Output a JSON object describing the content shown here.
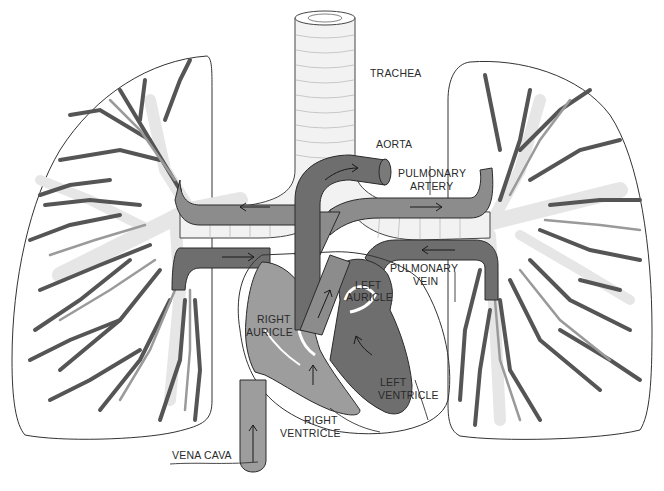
{
  "diagram": {
    "colors": {
      "background": "#ffffff",
      "oxygenated_vessel": "#8c8c8c",
      "deoxygenated_vessel": "#6e6e6e",
      "right_heart": "#9d9d9d",
      "left_heart": "#6e6e6e",
      "airway": "#f2f2f2",
      "outline": "#333333"
    },
    "labels": {
      "trachea": "TRACHEA",
      "aorta": "AORTA",
      "pulmonary_artery_1": "PULMONARY",
      "pulmonary_artery_2": "ARTERY",
      "pulmonary_vein_1": "PULMONARY",
      "pulmonary_vein_2": "VEIN",
      "left_auricle_1": "LEFT",
      "left_auricle_2": "AURICLE",
      "right_auricle_1": "RIGHT",
      "right_auricle_2": "AURICLE",
      "left_ventricle_1": "LEFT",
      "left_ventricle_2": "VENTRICLE",
      "right_ventricle_1": "RIGHT",
      "right_ventricle_2": "VENTRICLE",
      "vena_cava": "VENA CAVA"
    },
    "structures": [
      "left-lung",
      "right-lung",
      "trachea",
      "bronchi",
      "aorta",
      "pulmonary-artery",
      "pulmonary-vein",
      "heart",
      "vena-cava"
    ]
  }
}
